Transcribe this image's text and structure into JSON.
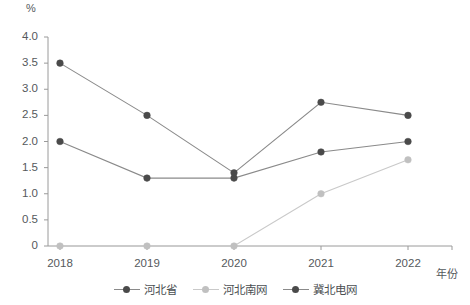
{
  "chart_data": {
    "type": "line",
    "title": "",
    "subtitle": "",
    "unit_label": "%",
    "xlabel": "年份",
    "ylabel": "",
    "categories": [
      "2018",
      "2019",
      "2020",
      "2021",
      "2022"
    ],
    "x": [
      2018,
      2019,
      2020,
      2021,
      2022
    ],
    "ylim": [
      0,
      4.0
    ],
    "yticks": [
      "0",
      "0.5",
      "1.0",
      "1.5",
      "2.0",
      "2.5",
      "3.0",
      "3.5",
      "4.0"
    ],
    "ytick_values": [
      0,
      0.5,
      1.0,
      1.5,
      2.0,
      2.5,
      3.0,
      3.5,
      4.0
    ],
    "grid": false,
    "legend_position": "bottom",
    "series": [
      {
        "name": "河北省",
        "color": "#4a4a4a",
        "line_color": "#8a8a8a",
        "values": [
          2.0,
          1.3,
          1.3,
          1.8,
          2.0
        ]
      },
      {
        "name": "河北南网",
        "color": "#c0c0c0",
        "line_color": "#c9c9c9",
        "values": [
          0,
          0,
          0,
          1.0,
          1.65
        ]
      },
      {
        "name": "冀北电网",
        "color": "#4a4a4a",
        "line_color": "#8a8a8a",
        "values": [
          3.5,
          2.5,
          1.4,
          2.75,
          2.5
        ]
      }
    ]
  },
  "axis": {
    "axis_color": "#9a9a9a",
    "text_color": "#55595c"
  }
}
